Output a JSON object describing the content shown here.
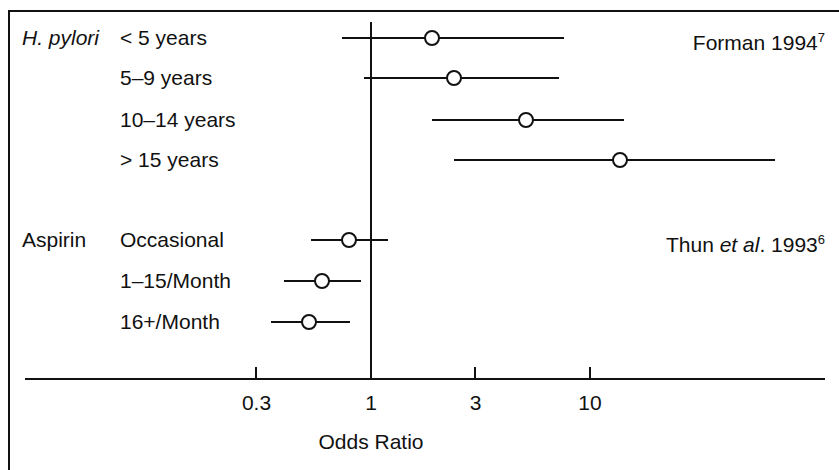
{
  "chart_data": {
    "type": "scatter",
    "plot_style": "forest-plot",
    "title": "",
    "xlabel": "Odds Ratio",
    "ylabel": "",
    "xscale": "log",
    "xticks": [
      0.3,
      1,
      3,
      10
    ],
    "xtick_labels": [
      "0.3",
      "1",
      "3",
      "10"
    ],
    "xlim": [
      0.22,
      22
    ],
    "reference_line": 1,
    "grid": false,
    "legend": false,
    "groups": [
      {
        "name": "H. pylori",
        "name_italic": true,
        "citation": "Forman 1994",
        "citation_superscript": "7",
        "rows": [
          {
            "label": "< 5 years",
            "or": 1.9,
            "ci_low": 0.74,
            "ci_high": 7.6
          },
          {
            "label": "5–9 years",
            "or": 2.4,
            "ci_low": 0.93,
            "ci_high": 7.2
          },
          {
            "label": "10–14 years",
            "or": 5.1,
            "ci_low": 1.9,
            "ci_high": 14.3
          },
          {
            "label": "> 15 years",
            "or": 13.7,
            "ci_low": 2.4,
            "ci_high": 70.0
          }
        ]
      },
      {
        "name": "Aspirin",
        "name_italic": false,
        "citation": "Thun et al. 1993",
        "citation_superscript": "6",
        "rows": [
          {
            "label": "Occasional",
            "or": 0.79,
            "ci_low": 0.53,
            "ci_high": 1.19
          },
          {
            "label": "1–15/Month",
            "or": 0.6,
            "ci_low": 0.4,
            "ci_high": 0.9
          },
          {
            "label": "16+/Month",
            "or": 0.52,
            "ci_low": 0.35,
            "ci_high": 0.8
          }
        ]
      }
    ]
  },
  "labels": {
    "group_hpylori": "H. pylori",
    "group_aspirin": "Aspirin",
    "row_1": "< 5 years",
    "row_2": "5–9 years",
    "row_3": "10–14 years",
    "row_4": "> 15 years",
    "row_5": "Occasional",
    "row_6": "1–15/Month",
    "row_7": "16+/Month",
    "axis_title": "Odds Ratio",
    "tick_0": "0.3",
    "tick_1": "1",
    "tick_2": "3",
    "tick_3": "10",
    "citation_forman": "Forman 1994",
    "citation_forman_sup": "7",
    "citation_thun_a": "Thun ",
    "citation_thun_italic": "et al",
    "citation_thun_b": ". 1993",
    "citation_thun_sup": "6"
  },
  "colors": {
    "ink": "#111111",
    "background": "#ffffff"
  }
}
